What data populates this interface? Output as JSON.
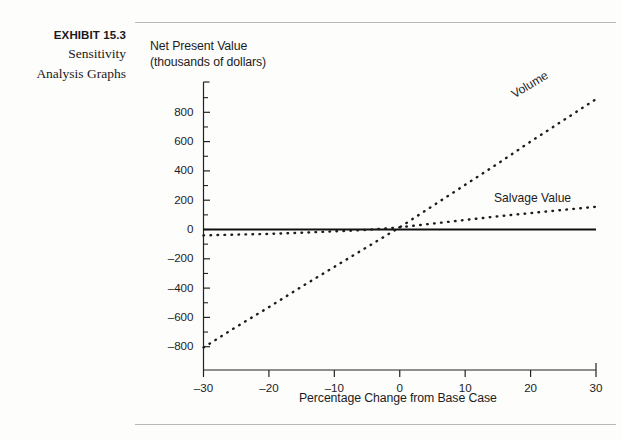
{
  "caption": {
    "exhibit_number": "EXHIBIT 15.3",
    "exhibit_title_line1": "Sensitivity",
    "exhibit_title_line2": "Analysis Graphs"
  },
  "chart_data": {
    "type": "line",
    "title": "",
    "ylabel_line1": "Net Present Value",
    "ylabel_line2": "(thousands of dollars)",
    "xlabel": "Percentage Change from Base Case",
    "xlim": [
      -30,
      30
    ],
    "ylim": [
      -900,
      950
    ],
    "xticks": [
      -30,
      -20,
      -10,
      0,
      10,
      20,
      30
    ],
    "xtick_labels": [
      "–30",
      "–20",
      "–10",
      "0",
      "10",
      "20",
      "30"
    ],
    "yticks": [
      800,
      600,
      400,
      200,
      0,
      -200,
      -400,
      -600,
      -800
    ],
    "ytick_labels": [
      "800",
      "600",
      "400",
      "200",
      "0",
      "–200",
      "–400",
      "–600",
      "–800"
    ],
    "yminorticks": [
      900,
      700,
      500,
      300,
      100,
      -100,
      -300,
      -500,
      -700
    ],
    "grid": false,
    "legend_position": "inline-at-line-end",
    "zero_line": {
      "value": 0,
      "style": "solid",
      "color": "#111111"
    },
    "series": [
      {
        "name": "Volume",
        "style": "dotted",
        "color": "#1c1c1c",
        "x": [
          -30,
          -25,
          -20,
          -15,
          -10,
          -5,
          0,
          5,
          10,
          15,
          20,
          25,
          30
        ],
        "values": [
          -805,
          -665,
          -530,
          -390,
          -255,
          -120,
          15,
          160,
          305,
          450,
          600,
          745,
          890
        ]
      },
      {
        "name": "Salvage Value",
        "style": "dotted",
        "color": "#1c1c1c",
        "x": [
          -30,
          -25,
          -20,
          -15,
          -10,
          -5,
          0,
          5,
          10,
          15,
          20,
          25,
          30
        ],
        "values": [
          -40,
          -35,
          -30,
          -22,
          -13,
          -3,
          15,
          40,
          65,
          90,
          112,
          134,
          155
        ]
      }
    ]
  }
}
